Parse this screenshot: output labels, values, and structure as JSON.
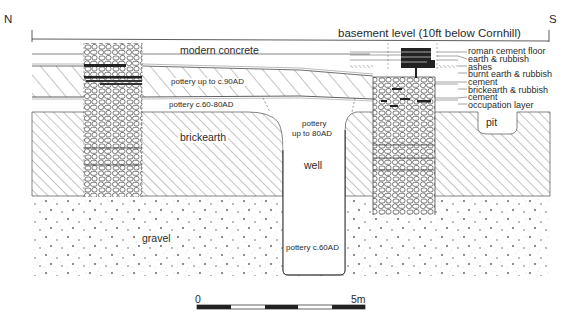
{
  "figure": {
    "orientation": {
      "north": "N",
      "south": "S"
    },
    "header_label": "basement level (10ft below Cornhill)",
    "layers": {
      "modern_concrete": "modern concrete",
      "pottery_upper": "pottery up to c.90AD",
      "pottery_lower": "pottery c.60-80AD",
      "brickearth": "brickearth",
      "gravel": "gravel"
    },
    "features": {
      "well": "well",
      "well_upper_fill_line1": "pottery",
      "well_upper_fill_line2": "up to 80AD",
      "well_lower_fill": "pottery c.60AD",
      "pit": "pit"
    },
    "legend": [
      "roman cement floor",
      "earth & rubbish",
      "ashes",
      "burnt earth & rubbish",
      "cement",
      "brickearth & rubbish",
      "cement",
      "occupation layer"
    ],
    "scale_bar": {
      "start_label": "0",
      "end_label": "5m",
      "segments": 5
    },
    "colors": {
      "ink": "#2a2a2a",
      "paper": "#ffffff",
      "stipple": "#9a9a9a"
    }
  }
}
